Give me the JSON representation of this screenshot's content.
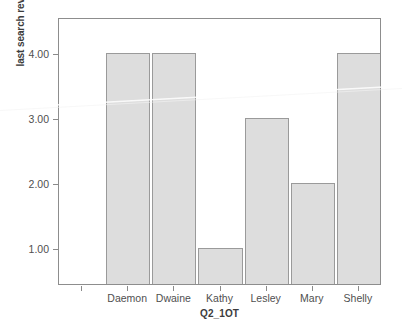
{
  "chart_data": {
    "type": "bar",
    "title": "",
    "subtitle": "",
    "xlabel": "Q2_1OT",
    "ylabel": "last search revelance",
    "categories": [
      "Daemon",
      "Dwaine",
      "Kathy",
      "Lesley",
      "Mary",
      "Shelly"
    ],
    "values": [
      4.0,
      4.0,
      1.0,
      3.0,
      2.0,
      4.0
    ],
    "series": [
      {
        "name": "last search revelance",
        "values": [
          4.0,
          4.0,
          1.0,
          3.0,
          2.0,
          4.0
        ]
      }
    ],
    "ytick_labels": [
      "4.00",
      "3.00",
      "2.00",
      "1.00"
    ],
    "ytick_values": [
      4.0,
      3.0,
      2.0,
      1.0
    ],
    "ylim": [
      0.45,
      4.55
    ],
    "grid": false,
    "legend": false,
    "legend_position": "none",
    "bar_fill_color": "#dddddd",
    "bar_border_color": "#9a9a9a",
    "frame_color": "#8d8d8d",
    "background_color": "#ffffff",
    "text_color": "#4f4f4f"
  }
}
